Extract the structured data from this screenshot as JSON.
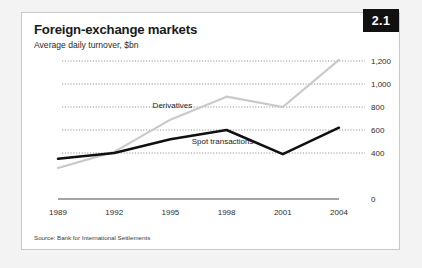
{
  "figure": {
    "number": "2.1",
    "title": "Foreign-exchange markets",
    "subtitle": "Average daily turnover, $bn",
    "source": "Source: Bank for International Settlements"
  },
  "chart_data": {
    "type": "line",
    "title": "Foreign-exchange markets",
    "subtitle": "Average daily turnover, $bn",
    "xlabel": "",
    "ylabel": "",
    "categories": [
      "1989",
      "1992",
      "1995",
      "1998",
      "2001",
      "2004"
    ],
    "x": [
      1989,
      1992,
      1995,
      1998,
      2001,
      2004
    ],
    "ylim": [
      0,
      1200
    ],
    "yticks": [
      0,
      400,
      600,
      800,
      1000,
      1200
    ],
    "ytick_labels": [
      "0",
      "400",
      "600",
      "800",
      "1,000",
      "1,200"
    ],
    "grid": true,
    "legend": "inline-labels",
    "series": [
      {
        "name": "Derivatives",
        "color": "#c9c9c9",
        "values": [
          270,
          410,
          690,
          890,
          800,
          1210
        ],
        "label_x": "1995",
        "label_text": "Derivatives"
      },
      {
        "name": "Spot transactions",
        "color": "#101010",
        "values": [
          350,
          400,
          520,
          600,
          390,
          620
        ],
        "label_x": "1998",
        "label_text": "Spot transactions"
      }
    ]
  }
}
